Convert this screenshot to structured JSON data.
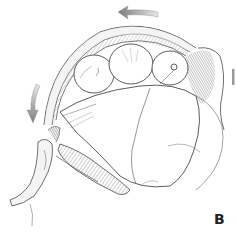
{
  "figure": {
    "panel_label": "B",
    "style": "pencil sketch illustration",
    "colors": {
      "background": "#ffffff",
      "line": "#3a3a3a",
      "shade_dark": "#6a6a6a",
      "shade_mid": "#9a9a9a",
      "shade_light": "#c8c8c8",
      "arrow": "#8c8c8c"
    },
    "arrows": [
      {
        "name": "top-arrow",
        "direction": "left"
      },
      {
        "name": "left-arrow",
        "direction": "down"
      },
      {
        "name": "right-marker",
        "direction": "vertical-bar"
      }
    ]
  }
}
